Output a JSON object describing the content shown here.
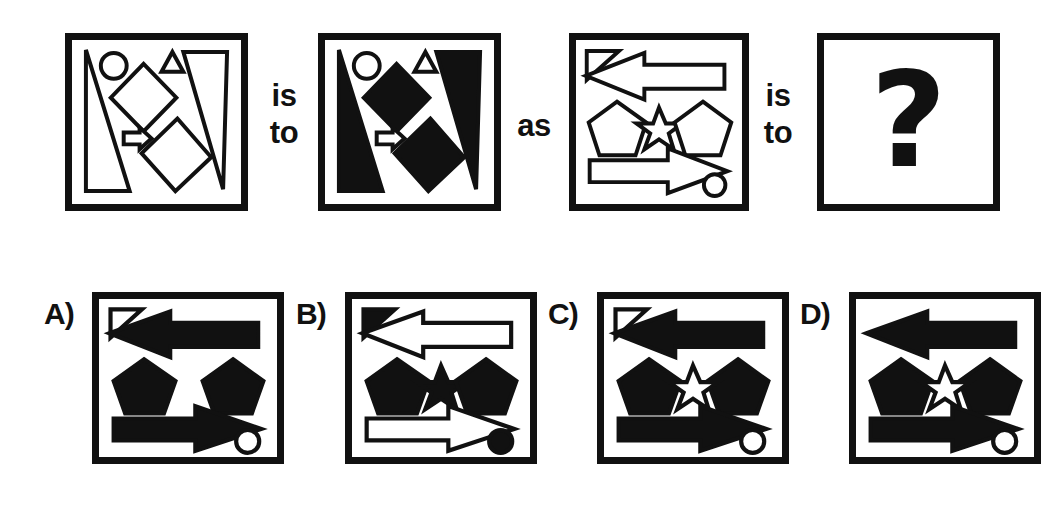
{
  "puzzle": {
    "type": "visual-analogy-matrix",
    "prompt_structure": "A is to B as C is to ?",
    "connectors": {
      "first": "is\nto",
      "first_line1": "is",
      "first_line2": "to",
      "middle": "as",
      "second_line1": "is",
      "second_line2": "to"
    },
    "question_mark": "?",
    "colors": {
      "ink": "#111111",
      "paper": "#ffffff",
      "frame": "#111111"
    }
  },
  "top_row": {
    "panels": [
      {
        "id": "panel-a",
        "position": "first",
        "fill_rule": "all shapes unfilled (white with black outline)",
        "shapes": [
          {
            "name": "tall-triangle-left",
            "size": "large",
            "fill": "white"
          },
          {
            "name": "tall-triangle-right",
            "size": "large",
            "fill": "white"
          },
          {
            "name": "circle-small",
            "size": "small",
            "fill": "white"
          },
          {
            "name": "triangle-small",
            "size": "small",
            "fill": "white"
          },
          {
            "name": "diamond-upper",
            "size": "large",
            "fill": "white"
          },
          {
            "name": "diamond-lower",
            "size": "large",
            "fill": "white"
          },
          {
            "name": "arrow-right-small",
            "size": "small",
            "fill": "white"
          }
        ]
      },
      {
        "id": "panel-b",
        "position": "second",
        "fill_rule": "large shapes filled black, small shapes remain white",
        "shapes": [
          {
            "name": "tall-triangle-left",
            "size": "large",
            "fill": "black"
          },
          {
            "name": "tall-triangle-right",
            "size": "large",
            "fill": "black"
          },
          {
            "name": "circle-small",
            "size": "small",
            "fill": "white"
          },
          {
            "name": "triangle-small",
            "size": "small",
            "fill": "white"
          },
          {
            "name": "diamond-upper",
            "size": "large",
            "fill": "black"
          },
          {
            "name": "diamond-lower",
            "size": "large",
            "fill": "black"
          },
          {
            "name": "arrow-right-small",
            "size": "small",
            "fill": "white"
          }
        ]
      },
      {
        "id": "panel-c",
        "position": "third",
        "fill_rule": "all shapes unfilled (white with black outline)",
        "shapes": [
          {
            "name": "triangle-small-corner",
            "size": "small",
            "fill": "white"
          },
          {
            "name": "arrow-left-large",
            "size": "large",
            "fill": "white"
          },
          {
            "name": "pentagon-left",
            "size": "large",
            "fill": "white"
          },
          {
            "name": "star-small",
            "size": "small",
            "fill": "white"
          },
          {
            "name": "pentagon-right",
            "size": "large",
            "fill": "white"
          },
          {
            "name": "arrow-right-large",
            "size": "large",
            "fill": "white"
          },
          {
            "name": "circle-small",
            "size": "small",
            "fill": "white"
          }
        ]
      },
      {
        "id": "panel-question",
        "position": "fourth",
        "fill_rule": "unknown",
        "content": "?"
      }
    ]
  },
  "answer_options": [
    {
      "letter": "A)",
      "id": "option-a",
      "shapes": [
        {
          "name": "triangle-small-corner",
          "size": "small",
          "fill": "white"
        },
        {
          "name": "arrow-left-large",
          "size": "large",
          "fill": "black"
        },
        {
          "name": "pentagon-left",
          "size": "large",
          "fill": "black"
        },
        {
          "name": "pentagon-right",
          "size": "large",
          "fill": "black"
        },
        {
          "name": "arrow-right-large",
          "size": "large",
          "fill": "black"
        },
        {
          "name": "circle-small",
          "size": "small",
          "fill": "white"
        }
      ],
      "note": "star is missing"
    },
    {
      "letter": "B)",
      "id": "option-b",
      "shapes": [
        {
          "name": "triangle-small-corner",
          "size": "small",
          "fill": "black"
        },
        {
          "name": "arrow-left-large",
          "size": "large",
          "fill": "white"
        },
        {
          "name": "pentagon-left",
          "size": "large",
          "fill": "black"
        },
        {
          "name": "star-small",
          "size": "small",
          "fill": "black"
        },
        {
          "name": "pentagon-right",
          "size": "large",
          "fill": "black"
        },
        {
          "name": "arrow-right-large",
          "size": "large",
          "fill": "white"
        },
        {
          "name": "circle-small",
          "size": "small",
          "fill": "black"
        }
      ],
      "note": "small shapes black, arrows white - inverted"
    },
    {
      "letter": "C)",
      "id": "option-c",
      "shapes": [
        {
          "name": "triangle-small-corner",
          "size": "small",
          "fill": "white"
        },
        {
          "name": "arrow-left-large",
          "size": "large",
          "fill": "black"
        },
        {
          "name": "pentagon-left",
          "size": "large",
          "fill": "black"
        },
        {
          "name": "star-small",
          "size": "small",
          "fill": "white"
        },
        {
          "name": "pentagon-right",
          "size": "large",
          "fill": "black"
        },
        {
          "name": "arrow-right-large",
          "size": "large",
          "fill": "black"
        },
        {
          "name": "circle-small",
          "size": "small",
          "fill": "white"
        }
      ],
      "note": "large shapes black, small shapes white"
    },
    {
      "letter": "D)",
      "id": "option-d",
      "shapes": [
        {
          "name": "arrow-left-large",
          "size": "large",
          "fill": "black"
        },
        {
          "name": "pentagon-left",
          "size": "large",
          "fill": "black"
        },
        {
          "name": "star-small",
          "size": "small",
          "fill": "white"
        },
        {
          "name": "pentagon-right",
          "size": "large",
          "fill": "black"
        },
        {
          "name": "arrow-right-large",
          "size": "large",
          "fill": "black"
        },
        {
          "name": "circle-small",
          "size": "small",
          "fill": "white"
        }
      ],
      "note": "small corner triangle is missing"
    }
  ]
}
